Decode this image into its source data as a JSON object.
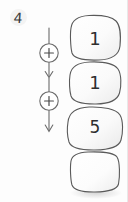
{
  "worksheet": {
    "problem_number": "4",
    "background_color": "#fdfdfd",
    "ink_color": "#3b3b3b"
  },
  "operator_chain": {
    "operators": [
      {
        "symbol": "+",
        "name": "plus-operator-1"
      },
      {
        "symbol": "+",
        "name": "plus-operator-2"
      }
    ],
    "arrow_direction": "down"
  },
  "block_stack": {
    "blocks": [
      {
        "value": "1",
        "empty": false
      },
      {
        "value": "1",
        "empty": false
      },
      {
        "value": "5",
        "empty": false
      },
      {
        "value": "",
        "empty": true
      }
    ],
    "fill_color": "#fbfbfb",
    "outline_color": "#555555"
  }
}
